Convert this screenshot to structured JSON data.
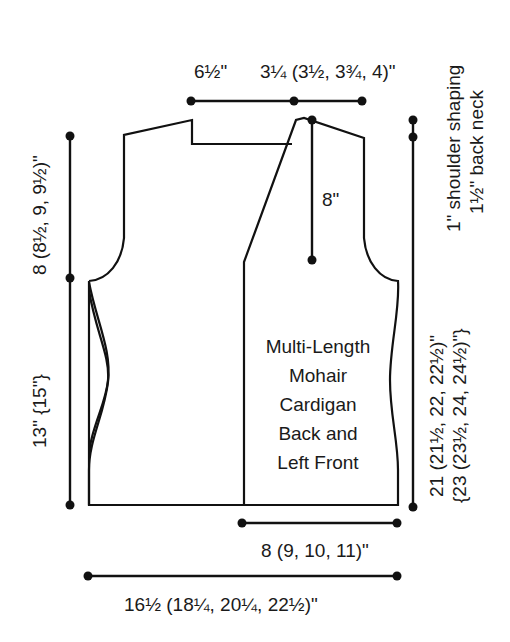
{
  "diagram": {
    "title_lines": [
      "Multi-Length",
      "Mohair",
      "Cardigan",
      "Back and",
      "Left Front"
    ],
    "measurements": {
      "top_left_width": "6½\"",
      "top_right_width": "3¼ (3½, 3¾, 4)\"",
      "neck_depth": "8\"",
      "right_note_1": "1\" shoulder shaping",
      "right_note_2": "1½\" back neck",
      "armhole_depth": "8 (8½, 9, 9½)\"",
      "side_length": "13\" {15\"}",
      "total_length_1": "21 (21½, 22, 22½)\"",
      "total_length_2": "{23 (23½, 24, 24½)\"}",
      "front_width": "8 (9, 10, 11)\"",
      "back_width": "16½ (18¼, 20¼, 22½)\""
    },
    "colors": {
      "line": "#111111",
      "text": "#1a1a1a",
      "background": "#ffffff"
    }
  }
}
